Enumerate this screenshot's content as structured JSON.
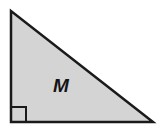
{
  "figure": {
    "name": "right-triangle-labeled-M",
    "type": "geometry-diagram",
    "background_color": "#ffffff",
    "canvas": {
      "width": 164,
      "height": 130
    },
    "shape": {
      "kind": "right-triangle",
      "fill_color": "#d4d4d4",
      "stroke_color": "#1a1a1a",
      "stroke_width": 2.5,
      "vertices": [
        {
          "name": "apex-top-left",
          "x": 11,
          "y": 11
        },
        {
          "name": "right-angle-bottom-left",
          "x": 11,
          "y": 122
        },
        {
          "name": "bottom-right",
          "x": 153,
          "y": 122
        }
      ],
      "points_attr": "11,11 11,122 153,122"
    },
    "right_angle_marker": {
      "name": "right-angle-square",
      "at_vertex": "right-angle-bottom-left",
      "size": 15,
      "stroke_color": "#1a1a1a",
      "stroke_width": 2,
      "fill": "none",
      "points_attr": "11,107 26,107 26,122 11,122"
    },
    "label": {
      "text": "M",
      "x": 61,
      "y": 87,
      "color": "#141414",
      "font_size": 19,
      "style": "bold-italic"
    }
  }
}
